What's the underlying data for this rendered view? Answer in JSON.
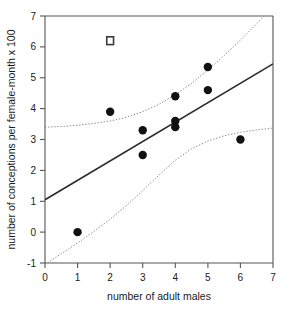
{
  "chart_data": {
    "type": "scatter",
    "title": "",
    "xlabel": "number of adult males",
    "ylabel": "number of conceptions per female-month x 100",
    "xlim": [
      0,
      7
    ],
    "ylim": [
      -1,
      7
    ],
    "xticks": [
      "0",
      "1",
      "2",
      "3",
      "4",
      "5",
      "6",
      "7"
    ],
    "yticks": [
      "-1",
      "0",
      "1",
      "2",
      "3",
      "4",
      "5",
      "6",
      "7"
    ],
    "grid": false,
    "legend": "none",
    "series": [
      {
        "name": "observations",
        "marker": "filled-circle",
        "color": "#111111",
        "points": [
          {
            "x": 1,
            "y": 0.0
          },
          {
            "x": 2,
            "y": 3.9
          },
          {
            "x": 3,
            "y": 3.3
          },
          {
            "x": 3,
            "y": 2.5
          },
          {
            "x": 4,
            "y": 4.4
          },
          {
            "x": 4,
            "y": 3.6
          },
          {
            "x": 4,
            "y": 3.4
          },
          {
            "x": 5,
            "y": 5.35
          },
          {
            "x": 5,
            "y": 4.6
          },
          {
            "x": 6,
            "y": 3.0
          }
        ]
      },
      {
        "name": "excluded-outlier",
        "marker": "open-square",
        "color": "#3a3a3a",
        "points": [
          {
            "x": 2,
            "y": 6.2
          }
        ]
      }
    ],
    "fit_line": {
      "name": "regression line",
      "color": "#2b2b2b",
      "x": [
        0,
        7
      ],
      "y": [
        1.05,
        5.45
      ]
    },
    "confidence_bands": {
      "name": "95% confidence limits",
      "color": "#8c8c8c",
      "style": "dotted",
      "upper": {
        "x": [
          0.0,
          0.5,
          1.0,
          1.5,
          2.0,
          2.5,
          3.0,
          3.5,
          4.0,
          4.5,
          5.0,
          5.5,
          6.0,
          6.5,
          7.0
        ],
        "y": [
          3.4,
          3.42,
          3.46,
          3.52,
          3.6,
          3.72,
          3.9,
          4.14,
          4.45,
          4.82,
          5.25,
          5.72,
          6.22,
          6.75,
          7.3
        ]
      },
      "lower": {
        "x": [
          0.0,
          0.5,
          1.0,
          1.5,
          2.0,
          2.5,
          3.0,
          3.5,
          4.0,
          4.5,
          5.0,
          5.5,
          6.0,
          6.5,
          7.0
        ],
        "y": [
          -1.05,
          -0.7,
          -0.35,
          0.02,
          0.42,
          0.86,
          1.34,
          1.85,
          2.33,
          2.7,
          2.95,
          3.12,
          3.23,
          3.31,
          3.37
        ]
      }
    }
  },
  "axes": {
    "x_title": "number of adult males",
    "y_title": "number of conceptions per female-month x 100"
  }
}
